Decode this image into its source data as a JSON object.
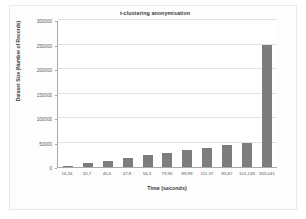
{
  "chart_data": {
    "type": "bar",
    "title": "t-clustering anonymisation",
    "xlabel": "Time (seconds)",
    "ylabel": "Dataset Size (Number of Records)",
    "categories": [
      "16,34",
      "32,7",
      "45,6",
      "47,8",
      "56,3",
      "79,95",
      "89,99",
      "111,37",
      "85,87",
      "101,148",
      "305,041"
    ],
    "values": [
      3000,
      8000,
      13000,
      18000,
      24000,
      29000,
      34000,
      39000,
      44000,
      49000,
      250000
    ],
    "ylim": [
      0,
      300000
    ],
    "yticks": [
      0,
      50000,
      100000,
      150000,
      200000,
      250000,
      300000
    ],
    "ytick_labels": [
      "0",
      "50000",
      "100000",
      "150000",
      "200000",
      "250000",
      "300000"
    ],
    "grid": true,
    "legend": false,
    "bar_color": "#7d7d7d",
    "axis_color": "#a9a9a9",
    "gridline_color": "#e2e2e2",
    "background_color": "#ffffff"
  }
}
